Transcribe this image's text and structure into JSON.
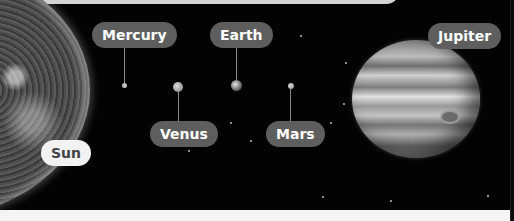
{
  "diagram": {
    "type": "solar-system-labels",
    "labels": [
      {
        "id": "sun",
        "text": "Sun"
      },
      {
        "id": "mercury",
        "text": "Mercury"
      },
      {
        "id": "venus",
        "text": "Venus"
      },
      {
        "id": "earth",
        "text": "Earth"
      },
      {
        "id": "mars",
        "text": "Mars"
      },
      {
        "id": "jupiter",
        "text": "Jupiter"
      }
    ],
    "colors": {
      "background": "#030303",
      "label_dark": "#5e5e5e",
      "label_light": "#f2f2f2",
      "label_text_light": "#ffffff",
      "label_text_dark": "#444444",
      "leader_line": "#8a8a8a"
    }
  }
}
